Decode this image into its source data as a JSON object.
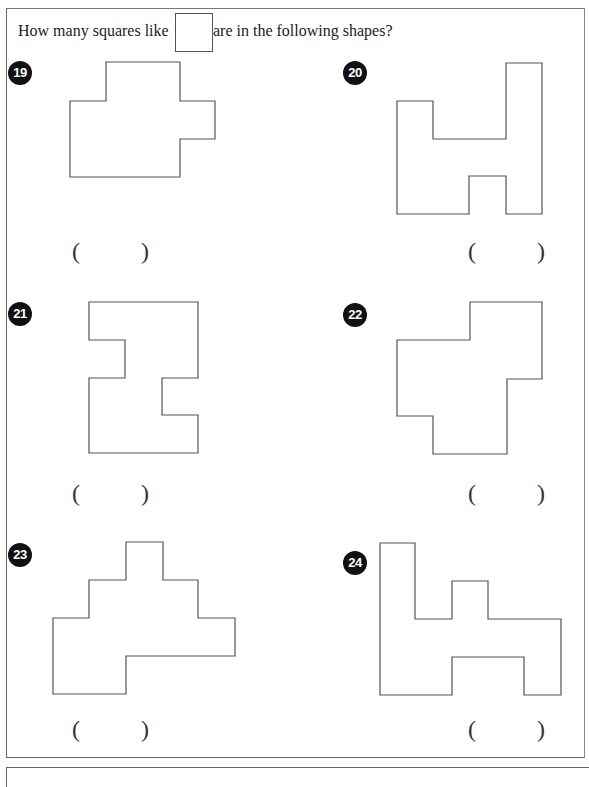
{
  "instruction": {
    "before": "How many squares like",
    "after": "are in the following shapes?"
  },
  "problems": [
    {
      "number": "19",
      "answer_open": "(",
      "answer_close": ")",
      "answer": ""
    },
    {
      "number": "20",
      "answer_open": "(",
      "answer_close": ")",
      "answer": ""
    },
    {
      "number": "21",
      "answer_open": "(",
      "answer_close": ")",
      "answer": ""
    },
    {
      "number": "22",
      "answer_open": "(",
      "answer_close": ")",
      "answer": ""
    },
    {
      "number": "23",
      "answer_open": "(",
      "answer_close": ")",
      "answer": ""
    },
    {
      "number": "24",
      "answer_open": "(",
      "answer_close": ")",
      "answer": ""
    }
  ],
  "colors": {
    "badge": "#111111",
    "stroke": "#555555",
    "background": "#ffffff"
  }
}
